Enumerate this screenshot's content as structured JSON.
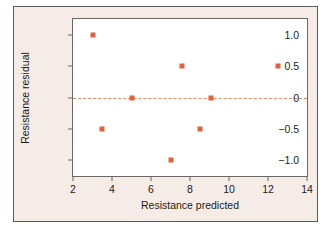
{
  "chart_data": {
    "type": "scatter",
    "title": "",
    "xlabel": "Resistance predicted",
    "ylabel": "Resistance residual",
    "xlim": [
      2,
      14
    ],
    "ylim": [
      -1.25,
      1.25
    ],
    "xticks": [
      2,
      4,
      6,
      8,
      10,
      12,
      14
    ],
    "xticklabels": [
      "2",
      "4",
      "6",
      "8",
      "10",
      "12",
      "14"
    ],
    "yticks": [
      1.0,
      0.5,
      0,
      -0.5,
      -1.0
    ],
    "yticklabels": [
      "1.0",
      "0.5",
      "0",
      "−0.5",
      "−1.0"
    ],
    "grid": false,
    "legend": null,
    "reference_lines": [
      {
        "name": "zero-residual-line",
        "orientation": "horizontal",
        "y": 0,
        "style": "dashed",
        "color": "#e8764f"
      }
    ],
    "series": [
      {
        "name": "residuals",
        "marker": "square",
        "color": "#e2603a",
        "points": [
          {
            "x": 3.0,
            "y": 1.0
          },
          {
            "x": 3.5,
            "y": -0.5
          },
          {
            "x": 5.0,
            "y": 0.0
          },
          {
            "x": 7.0,
            "y": -1.0
          },
          {
            "x": 7.6,
            "y": 0.5
          },
          {
            "x": 8.5,
            "y": -0.5
          },
          {
            "x": 9.1,
            "y": 0.0
          },
          {
            "x": 12.5,
            "y": 0.5
          }
        ]
      }
    ],
    "colors": {
      "marker": "#e2603a",
      "reference_line": "#e8764f",
      "figure_background": "#f6ece7",
      "plot_background": "#ffffff",
      "axis": "#6b6967",
      "text": "#1c1b1a"
    }
  }
}
